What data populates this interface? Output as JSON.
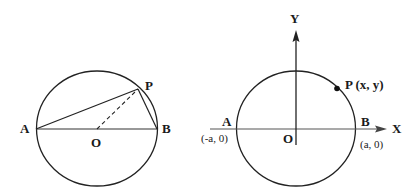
{
  "diagram_left": {
    "description": "Circle with diameter AB, center O, point P on circle; chords AP and PB, dashed radius OP",
    "labels": {
      "A": "A",
      "B": "B",
      "O": "O",
      "P": "P"
    },
    "colors": {
      "stroke": "#222222",
      "background": "#ffffff"
    }
  },
  "diagram_right": {
    "description": "Circle centered at origin O on XY axes, intersecting X axis at A(-a,0) and B(a,0), point P(x,y) on circle",
    "labels": {
      "A": "A",
      "A_coord": "(-a, 0)",
      "B": "B",
      "B_coord": "(a, 0)",
      "O": "O",
      "P": "P (x, y)",
      "X_axis": "X",
      "Y_axis": "Y"
    },
    "colors": {
      "stroke": "#222222",
      "axis": "#333333",
      "point": "#111111"
    }
  }
}
